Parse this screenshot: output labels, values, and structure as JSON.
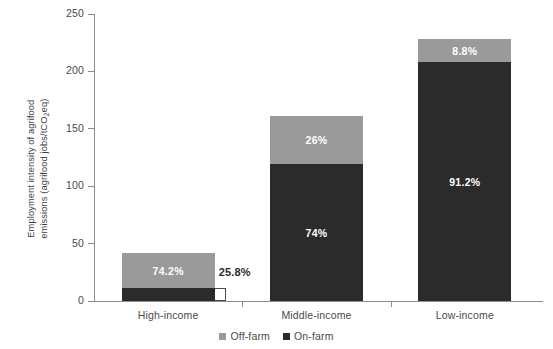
{
  "chart_data": {
    "type": "bar",
    "subtype": "stacked-bar",
    "title": "",
    "xlabel": "",
    "ylabel": "Employment intensity of agrifood emissions (agrifood jobs/tCO2eq)",
    "ylabel_line1": "Employment intensity of agrifood",
    "ylabel_line2_pre": "emissions (agrifood jobs/tCO",
    "ylabel_line2_sub": "2",
    "ylabel_line2_post": "eq)",
    "categories": [
      "High-income",
      "Middle-income",
      "Low-income"
    ],
    "ylim": [
      0,
      250
    ],
    "yticks": [
      0,
      50,
      100,
      150,
      200,
      250
    ],
    "ytick_labels": [
      "0",
      "50",
      "100",
      "150",
      "200",
      "250"
    ],
    "grid": false,
    "legend_position": "bottom-center",
    "series": [
      {
        "name": "Off-farm",
        "color": "#9a9a9a",
        "values": [
          31.0,
          42.0,
          20.0
        ],
        "labels": [
          "74.2%",
          "26%",
          "8.8%"
        ],
        "label_visible": [
          true,
          true,
          true
        ]
      },
      {
        "name": "On-farm",
        "color": "#2b2b2b",
        "values": [
          11.0,
          119.0,
          208.0
        ],
        "labels": [
          "25.8%",
          "74%",
          "91.2%"
        ],
        "label_visible": [
          false,
          true,
          true
        ]
      }
    ],
    "totals": [
      42.0,
      161.0,
      228.0
    ],
    "annotations": [
      {
        "text": "25.8%",
        "points_to": "High-income On-farm segment",
        "style": "bracket-callout"
      }
    ]
  },
  "legend": {
    "items": [
      {
        "label": "Off-farm",
        "color": "#9a9a9a"
      },
      {
        "label": "On-farm",
        "color": "#2b2b2b"
      }
    ]
  },
  "colors": {
    "off_farm": "#9a9a9a",
    "on_farm": "#2b2b2b",
    "axis": "#8d8d8d",
    "text": "#4a4a4a",
    "background": "#ffffff"
  }
}
